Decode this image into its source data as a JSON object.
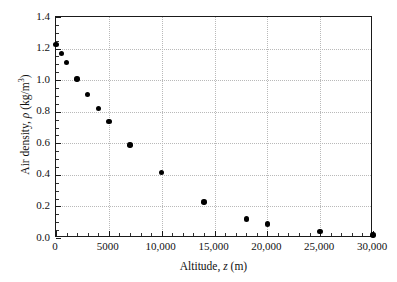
{
  "chart_data": {
    "type": "scatter",
    "title": "",
    "xlabel_parts": {
      "pre": "Altitude, ",
      "symbol": "z",
      "post": " (m)"
    },
    "ylabel_parts": {
      "pre": "Air density, ",
      "symbol": "ρ",
      "post": " (kg/m",
      "sup": "3",
      "post2": ")"
    },
    "xlabel": "Altitude, z (m)",
    "ylabel": "Air density, ρ (kg/m3)",
    "xlim": [
      0,
      30000
    ],
    "ylim": [
      0.0,
      1.4
    ],
    "grid": true,
    "legend": "none",
    "x_ticks": [
      0,
      5000,
      10000,
      15000,
      20000,
      25000,
      30000
    ],
    "x_tick_labels": [
      "0",
      "5000",
      "10,000",
      "15,000",
      "20,000",
      "25,000",
      "30,000"
    ],
    "x_minor_step": 1000,
    "y_ticks": [
      0.0,
      0.2,
      0.4,
      0.6,
      0.8,
      1.0,
      1.2,
      1.4
    ],
    "y_tick_labels": [
      "0.0",
      "0.2",
      "0.4",
      "0.6",
      "0.8",
      "1.0",
      "1.2",
      "1.4"
    ],
    "y_minor_step": 0.05,
    "marker": "filled-circle",
    "marker_color": "#000000",
    "grid_color": "#b9b9b9",
    "axis_color": "#1a1a1a",
    "background_color": "#ffffff",
    "x": [
      0,
      500,
      1000,
      2000,
      3000,
      4000,
      5000,
      7000,
      10000,
      14000,
      18000,
      20000,
      25000,
      30000
    ],
    "y": [
      1.225,
      1.167,
      1.112,
      1.007,
      0.9093,
      0.8194,
      0.7364,
      0.59,
      0.4135,
      0.2279,
      0.1216,
      0.08891,
      0.04008,
      0.01841
    ],
    "points": [
      {
        "x": 0,
        "y": 1.225
      },
      {
        "x": 500,
        "y": 1.167
      },
      {
        "x": 1000,
        "y": 1.112
      },
      {
        "x": 2000,
        "y": 1.007
      },
      {
        "x": 3000,
        "y": 0.9093
      },
      {
        "x": 4000,
        "y": 0.8194
      },
      {
        "x": 5000,
        "y": 0.7364
      },
      {
        "x": 7000,
        "y": 0.59
      },
      {
        "x": 10000,
        "y": 0.4135
      },
      {
        "x": 14000,
        "y": 0.2279
      },
      {
        "x": 18000,
        "y": 0.1216
      },
      {
        "x": 20000,
        "y": 0.08891
      },
      {
        "x": 25000,
        "y": 0.04008
      },
      {
        "x": 30000,
        "y": 0.01841
      }
    ]
  }
}
